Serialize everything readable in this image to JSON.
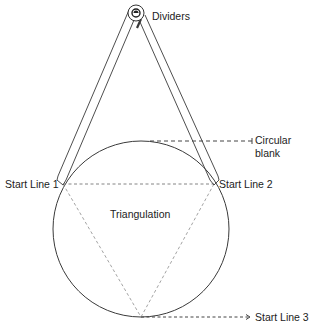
{
  "diagram": {
    "labels": {
      "dividers": "Dividers",
      "circular_blank_line1": "Circular",
      "circular_blank_line2": "blank",
      "start_line_1": "Start Line 1",
      "start_line_2": "Start Line 2",
      "start_line_3": "Start Line 3",
      "triangulation": "Triangulation"
    },
    "colors": {
      "line": "#3a3a3a",
      "dashed_construction": "#8a8a8a",
      "leader": "#444444",
      "background": "#ffffff"
    },
    "geometry": {
      "circle": {
        "cx": 141,
        "cy": 229,
        "r": 88
      },
      "pivot": {
        "x": 136,
        "y": 13
      },
      "start_points": [
        {
          "name": "Start Line 1",
          "x": 63,
          "y": 184
        },
        {
          "name": "Start Line 2",
          "x": 214,
          "y": 184
        },
        {
          "name": "Start Line 3",
          "x": 141,
          "y": 317
        }
      ]
    }
  }
}
